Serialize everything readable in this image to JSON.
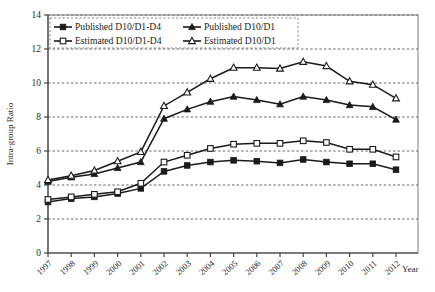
{
  "chart_data": {
    "type": "line",
    "title": "",
    "xlabel": "Year",
    "ylabel": "Intra-group Ratio",
    "xlim": [
      1997,
      2012
    ],
    "ylim": [
      0,
      14
    ],
    "ytick_step": 2,
    "yticks": [
      "0",
      "2",
      "4",
      "6",
      "8",
      "10",
      "12",
      "14"
    ],
    "grid": true,
    "grid_axis": "y",
    "legend_position": "top-left-inside",
    "categories": [
      "1997",
      "1998",
      "1999",
      "2000",
      "2001",
      "2002",
      "2003",
      "2004",
      "2005",
      "2006",
      "2007",
      "2008",
      "2009",
      "2010",
      "2011",
      "2012"
    ],
    "series": [
      {
        "name": "Published D10/D1-D4",
        "marker": "filled-square",
        "values": [
          3.0,
          3.2,
          3.3,
          3.5,
          3.8,
          4.8,
          5.15,
          5.35,
          5.45,
          5.4,
          5.3,
          5.5,
          5.35,
          5.25,
          5.25,
          4.9
        ]
      },
      {
        "name": "Estimated D10/D1-D4",
        "marker": "open-square",
        "values": [
          3.15,
          3.3,
          3.45,
          3.6,
          4.1,
          5.35,
          5.75,
          6.15,
          6.4,
          6.45,
          6.45,
          6.6,
          6.5,
          6.1,
          6.1,
          5.65
        ]
      },
      {
        "name": "Published D10/D1",
        "marker": "filled-triangle",
        "values": [
          4.2,
          4.45,
          4.65,
          5.0,
          5.35,
          7.9,
          8.45,
          8.9,
          9.2,
          9.0,
          8.75,
          9.2,
          9.0,
          8.7,
          8.6,
          7.85
        ]
      },
      {
        "name": "Estimated D10/D1",
        "marker": "open-triangle",
        "values": [
          4.3,
          4.55,
          4.85,
          5.4,
          5.95,
          8.65,
          9.45,
          10.25,
          10.9,
          10.9,
          10.85,
          11.25,
          11.0,
          10.1,
          9.9,
          9.1
        ]
      }
    ],
    "legend": [
      {
        "label": "Published D10/D1-D4",
        "marker": "filled-square"
      },
      {
        "label": "Published D10/D1",
        "marker": "filled-triangle"
      },
      {
        "label": "Estimated D10/D1-D4",
        "marker": "open-square"
      },
      {
        "label": "Estimated D10/D1",
        "marker": "open-triangle"
      }
    ],
    "colors": {
      "series": "#1a1a1a",
      "grid": "#4a4a4a",
      "axis": "#3a3a3a",
      "background": "#ffffff"
    }
  }
}
